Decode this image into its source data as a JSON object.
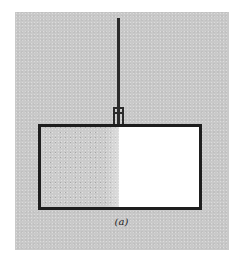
{
  "figure": {
    "label": "(a)"
  },
  "colors": {
    "panel_background": "#c9c9c9",
    "outline": "#1e1e1e",
    "filled_region": "#d8d8d8",
    "empty_region": "#ffffff"
  },
  "parts": {
    "rod": "vertical suspension rod",
    "collar": "clamp connecting rod to container",
    "container": "rectangular box",
    "left_half": "stippled filled half",
    "right_half": "empty half"
  }
}
